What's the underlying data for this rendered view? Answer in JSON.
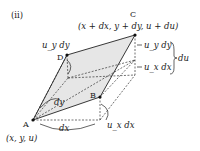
{
  "figure": {
    "panel_label": "(ⅱ)",
    "points": {
      "A": {
        "name": "A",
        "coords": "(x, y, u)"
      },
      "B": {
        "name": "B"
      },
      "C": {
        "name": "C",
        "coords": "(x + dx, y + dy, u + du)"
      },
      "D": {
        "name": "D"
      }
    },
    "edge_labels": {
      "dx": "dx",
      "dy": "dy"
    },
    "increment_labels": {
      "uy_dy_top": "u_y dy",
      "uy_dy_right": "u_y dy",
      "ux_dx_right": "u_x dx",
      "ux_dx_bottom": "u_x dx",
      "du": "du"
    },
    "colors": {
      "plane_fill": "#e6e6e6",
      "line": "#222222"
    }
  }
}
